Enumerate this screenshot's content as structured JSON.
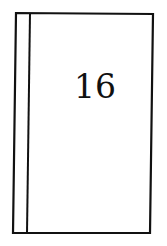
{
  "figure": {
    "label": "16",
    "stroke_color": "#111111",
    "background": "#ffffff"
  }
}
